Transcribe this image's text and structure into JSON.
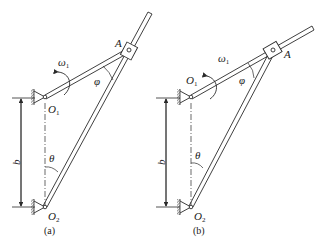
{
  "figures": [
    {
      "id": "a",
      "caption": "(a)",
      "labels": {
        "A": "A",
        "O1": "O",
        "O1_sub": "1",
        "O2": "O",
        "O2_sub": "2",
        "omega": "ω",
        "omega_sub": "1",
        "phi": "φ",
        "theta": "θ",
        "b": "b"
      }
    },
    {
      "id": "b",
      "caption": "(b)",
      "labels": {
        "A": "A",
        "O1": "O",
        "O1_sub": "1",
        "O2": "O",
        "O2_sub": "2",
        "omega": "ω",
        "omega_sub": "1",
        "phi": "φ",
        "theta": "θ",
        "b": "b"
      }
    }
  ],
  "colors": {
    "line": "#2a2a2a",
    "background": "#ffffff"
  }
}
